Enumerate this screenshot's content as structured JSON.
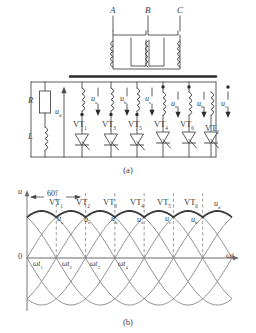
{
  "figure": {
    "captions": {
      "a": "(a)",
      "b": "(b)"
    }
  },
  "circuit": {
    "transformer": {
      "primary_terminals": [
        "A",
        "B",
        "C"
      ],
      "label_note": "three-phase primary windings A B C"
    },
    "load": {
      "resistor_label": "R",
      "inductor_label": "L",
      "output_voltage_label": "u",
      "output_voltage_sub": "d"
    },
    "branches": [
      {
        "thyristor": "VT",
        "thyristor_sub": "1",
        "voltage": "u",
        "voltage_sub": "a",
        "prime": false,
        "dot": "below"
      },
      {
        "thyristor": "VT",
        "thyristor_sub": "3",
        "voltage": "u",
        "voltage_sub": "b",
        "prime": false,
        "dot": "below"
      },
      {
        "thyristor": "VT",
        "thyristor_sub": "5",
        "voltage": "u",
        "voltage_sub": "c",
        "prime": false,
        "dot": "below"
      },
      {
        "thyristor": "VT",
        "thyristor_sub": "4",
        "voltage": "u",
        "voltage_sub": "a",
        "prime": true,
        "dot": "above"
      },
      {
        "thyristor": "VT",
        "thyristor_sub": "6",
        "voltage": "u",
        "voltage_sub": "b",
        "prime": true,
        "dot": "above"
      },
      {
        "thyristor": "VT",
        "thyristor_sub": "2",
        "voltage": "u",
        "voltage_sub": "c",
        "prime": true,
        "dot": "above"
      }
    ]
  },
  "chart_data": {
    "type": "line",
    "title": "",
    "xlabel": "ωt",
    "ylabel": "u",
    "origin_label": "0",
    "interval_label": "60°",
    "xlim": [
      0,
      420
    ],
    "ylim": [
      -1.15,
      1.15
    ],
    "grid": false,
    "legend_position": "inline-annotation",
    "conduction_sequence": [
      {
        "device": "VT",
        "sub": "1"
      },
      {
        "device": "VT",
        "sub": "2"
      },
      {
        "device": "VT",
        "sub": "3"
      },
      {
        "device": "VT",
        "sub": "4"
      },
      {
        "device": "VT",
        "sub": "5"
      },
      {
        "device": "VT",
        "sub": "6"
      }
    ],
    "phase_annotations": [
      {
        "name": "u",
        "sub": "a",
        "prime": false,
        "center_deg": 90
      },
      {
        "name": "u",
        "sub": "c",
        "prime": true,
        "center_deg": 150
      },
      {
        "name": "u",
        "sub": "b",
        "prime": false,
        "center_deg": 210
      },
      {
        "name": "u",
        "sub": "a",
        "prime": true,
        "center_deg": 270
      },
      {
        "name": "u",
        "sub": "c",
        "prime": false,
        "center_deg": 330
      },
      {
        "name": "u",
        "sub": "b",
        "prime": true,
        "center_deg": 390
      },
      {
        "name": "u",
        "sub": "d",
        "prime": false,
        "center_deg": 450
      }
    ],
    "x_tick_labels": [
      {
        "text": "ωt",
        "sub": "1",
        "deg": 60
      },
      {
        "text": "ωt",
        "sub": "2",
        "deg": 120
      },
      {
        "text": "ωt",
        "sub": "3",
        "deg": 180
      },
      {
        "text": "ωt",
        "sub": "4",
        "deg": 240
      }
    ],
    "series": [
      {
        "name": "u_a",
        "phase_deg": 0,
        "amplitude": 1
      },
      {
        "name": "u_c'",
        "phase_deg": 60,
        "amplitude": 1
      },
      {
        "name": "u_b",
        "phase_deg": 120,
        "amplitude": 1
      },
      {
        "name": "u_a'",
        "phase_deg": 180,
        "amplitude": 1
      },
      {
        "name": "u_c",
        "phase_deg": 240,
        "amplitude": 1
      },
      {
        "name": "u_b'",
        "phase_deg": 300,
        "amplitude": 1
      }
    ],
    "envelope": {
      "name": "u_d",
      "description": "upper envelope = max of six phase voltages, 6-pulse ripple"
    },
    "commutation_dashed_deg": [
      60,
      120,
      180,
      240,
      300,
      360
    ]
  },
  "colors": {
    "line": "#4a4a4a",
    "busbar": "#2b2b2b",
    "envelope": "#3a3a3a",
    "dashed": "#6a6a6a",
    "text": "#3a3a3a"
  }
}
